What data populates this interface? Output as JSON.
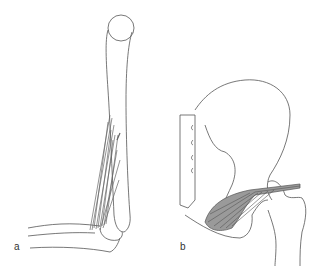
{
  "figure": {
    "panels": [
      {
        "id": "a",
        "label": "a",
        "subject": "humerus and forearm (elbow) with muscle fibers"
      },
      {
        "id": "b",
        "label": "b",
        "subject": "pelvis and femur (hip) with muscle fibers"
      }
    ],
    "colors": {
      "line": "#555555",
      "muscle": "#666666",
      "muscle_fill": "#9a9a9a",
      "background": "#ffffff"
    }
  }
}
